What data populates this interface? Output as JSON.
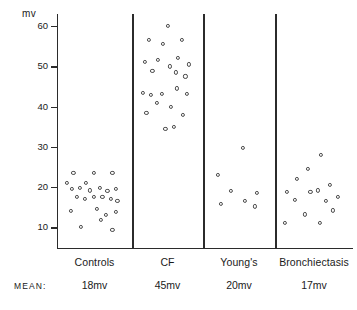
{
  "chart_data": {
    "type": "scatter",
    "title": "",
    "xlabel": "",
    "ylabel": "mv",
    "unit_label": "mv",
    "ylim": [
      5,
      63
    ],
    "yticks": [
      10,
      20,
      30,
      40,
      50,
      60
    ],
    "ytick_labels": [
      "10",
      "20",
      "30",
      "40",
      "50",
      "60"
    ],
    "grid": false,
    "legend": false,
    "mean_row_label": "MEAN:",
    "categories": [
      "Controls",
      "CF",
      "Young's",
      "Bronchiectasis"
    ],
    "means": [
      "18mv",
      "45mv",
      "20mv",
      "17mv"
    ],
    "mean_values": [
      18,
      45,
      20,
      17
    ],
    "groups": [
      {
        "name": "Controls",
        "mean": "18mv",
        "values": [
          24,
          23,
          24,
          23,
          21,
          20,
          20,
          19,
          20,
          18,
          18,
          17,
          18,
          17,
          18,
          17,
          16,
          19,
          16,
          14,
          13,
          14,
          12,
          12,
          10,
          9
        ],
        "points": [
          [
            0.18,
            23.5
          ],
          [
            0.38,
            21.0
          ],
          [
            0.5,
            23.5
          ],
          [
            0.8,
            23.5
          ],
          [
            0.08,
            21.0
          ],
          [
            0.16,
            19.5
          ],
          [
            0.28,
            19.8
          ],
          [
            0.44,
            19.2
          ],
          [
            0.6,
            19.8
          ],
          [
            0.72,
            19.0
          ],
          [
            0.86,
            19.5
          ],
          [
            0.24,
            17.5
          ],
          [
            0.36,
            17.0
          ],
          [
            0.5,
            17.6
          ],
          [
            0.64,
            17.5
          ],
          [
            0.78,
            17.0
          ],
          [
            0.88,
            16.5
          ],
          [
            0.14,
            14.0
          ],
          [
            0.56,
            14.5
          ],
          [
            0.7,
            13.0
          ],
          [
            0.86,
            13.8
          ],
          [
            0.3,
            10.2
          ],
          [
            0.62,
            11.8
          ],
          [
            0.8,
            9.3
          ]
        ]
      },
      {
        "name": "CF",
        "mean": "45mv",
        "values": [
          60,
          57,
          56,
          56,
          53,
          52,
          51,
          51,
          50,
          49,
          47,
          45,
          44,
          43,
          42,
          41,
          41,
          40,
          39,
          38,
          37,
          35,
          34,
          33
        ],
        "points": [
          [
            0.52,
            60.0
          ],
          [
            0.2,
            56.5
          ],
          [
            0.44,
            55.5
          ],
          [
            0.76,
            56.5
          ],
          [
            0.14,
            51.0
          ],
          [
            0.36,
            51.5
          ],
          [
            0.56,
            50.0
          ],
          [
            0.7,
            52.0
          ],
          [
            0.88,
            50.5
          ],
          [
            0.26,
            48.8
          ],
          [
            0.66,
            48.5
          ],
          [
            0.82,
            47.5
          ],
          [
            0.1,
            43.5
          ],
          [
            0.24,
            43.0
          ],
          [
            0.42,
            43.2
          ],
          [
            0.68,
            44.5
          ],
          [
            0.84,
            43.2
          ],
          [
            0.34,
            41.0
          ],
          [
            0.58,
            40.0
          ],
          [
            0.16,
            38.5
          ],
          [
            0.78,
            38.0
          ],
          [
            0.62,
            35.0
          ],
          [
            0.48,
            34.5
          ]
        ]
      },
      {
        "name": "Young's",
        "mean": "20mv",
        "values": [
          30,
          23,
          19,
          18,
          17,
          16,
          15,
          14
        ],
        "points": [
          [
            0.58,
            29.8
          ],
          [
            0.16,
            23.0
          ],
          [
            0.38,
            19.0
          ],
          [
            0.82,
            18.5
          ],
          [
            0.62,
            16.5
          ],
          [
            0.22,
            15.8
          ],
          [
            0.78,
            15.2
          ]
        ]
      },
      {
        "name": "Bronchiectasis",
        "mean": "17mv",
        "values": [
          28,
          24,
          22,
          21,
          20,
          19,
          18,
          17,
          16,
          15,
          14,
          13,
          11,
          10
        ],
        "points": [
          [
            0.62,
            28.0
          ],
          [
            0.42,
            24.5
          ],
          [
            0.26,
            22.0
          ],
          [
            0.58,
            19.2
          ],
          [
            0.76,
            20.5
          ],
          [
            0.1,
            18.8
          ],
          [
            0.46,
            18.8
          ],
          [
            0.88,
            17.5
          ],
          [
            0.22,
            16.8
          ],
          [
            0.7,
            16.5
          ],
          [
            0.38,
            13.2
          ],
          [
            0.08,
            11.2
          ],
          [
            0.6,
            11.2
          ],
          [
            0.8,
            14.2
          ]
        ]
      }
    ]
  }
}
